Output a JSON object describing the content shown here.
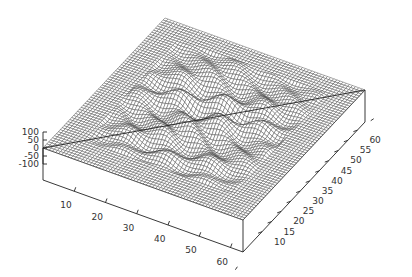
{
  "chart_data": {
    "type": "surface3d",
    "title": "",
    "xlabel": "",
    "ylabel": "",
    "zlabel": "",
    "grid_size": [
      64,
      64
    ],
    "x_range": [
      0,
      64
    ],
    "y_range": [
      0,
      64
    ],
    "zlim": [
      -100,
      100
    ],
    "x_ticks": [
      10,
      20,
      30,
      40,
      50,
      60
    ],
    "y_ticks": [
      10,
      15,
      20,
      25,
      30,
      35,
      40,
      45,
      50,
      55,
      60
    ],
    "z_ticks": [
      100,
      50,
      0,
      -50,
      -100
    ],
    "z_tick_labels": [
      "100",
      "50",
      "0",
      "-50",
      "-100"
    ],
    "x_tick_labels": [
      "10",
      "20",
      "30",
      "40",
      "50",
      "60"
    ],
    "y_tick_labels": [
      "10",
      "15",
      "20",
      "25",
      "30",
      "35",
      "40",
      "45",
      "50",
      "55",
      "60"
    ],
    "surface": {
      "description": "flat plane at z=0 with wavy oscillating region in the interior",
      "active_region": {
        "x": [
          8,
          56
        ],
        "y": [
          8,
          58
        ]
      },
      "amplitude": 55,
      "wave_x_freq": 0.35,
      "wave_y_freq": 0.9
    },
    "mesh_color": "#444444",
    "box_color": "#222222"
  }
}
